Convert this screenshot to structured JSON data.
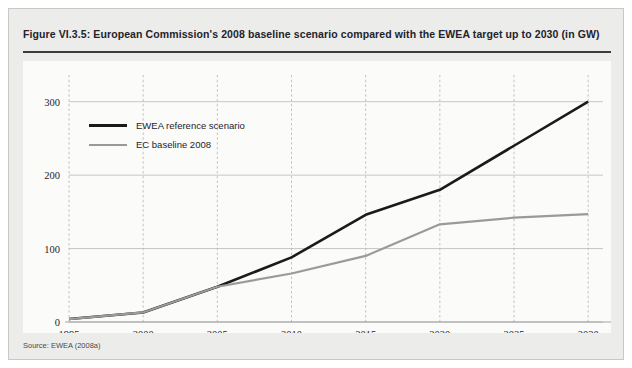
{
  "figure": {
    "title": "Figure VI.3.5: European Commission's 2008 baseline scenario compared with the EWEA target up to 2030 (in GW)",
    "source": "Source: EWEA (2008a)"
  },
  "colors": {
    "ewea_line": "#1a1a1a",
    "ec_line": "#9a9a9a",
    "panel_background": "#ececea",
    "plot_background": "#fbfbfa",
    "gridline": "#b9b9b9",
    "axis": "#9a9a9a",
    "title_rule": "#3c3c3c"
  },
  "legend": {
    "position": "top-left-inside-plot",
    "entries": [
      {
        "label": "EWEA reference scenario",
        "color": "#1a1a1a"
      },
      {
        "label": "EC baseline 2008",
        "color": "#9a9a9a"
      }
    ]
  },
  "chart_data": {
    "type": "line",
    "title": "Figure VI.3.5: European Commission's 2008 baseline scenario compared with the EWEA target up to 2030 (in GW)",
    "xlabel": "",
    "ylabel": "",
    "unit": "GW",
    "x": [
      1995,
      2000,
      2005,
      2010,
      2015,
      2020,
      2025,
      2030
    ],
    "xtick_labels": [
      "1995",
      "2000",
      "2005",
      "2010",
      "2015",
      "2020",
      "2025",
      "2030"
    ],
    "ytick_labels": [
      "0",
      "100",
      "200",
      "300"
    ],
    "yticks": [
      0,
      100,
      200,
      300
    ],
    "xlim": [
      1995,
      2031
    ],
    "ylim": [
      0,
      320
    ],
    "grid": {
      "horizontal": true,
      "vertical": true,
      "vertical_style": "dashed"
    },
    "series": [
      {
        "name": "EWEA reference scenario",
        "color": "#1a1a1a",
        "values": [
          4,
          13,
          48,
          88,
          146,
          180,
          240,
          300
        ]
      },
      {
        "name": "EC baseline 2008",
        "color": "#9a9a9a",
        "values": [
          4,
          13,
          48,
          66,
          90,
          133,
          142,
          147
        ]
      }
    ]
  }
}
